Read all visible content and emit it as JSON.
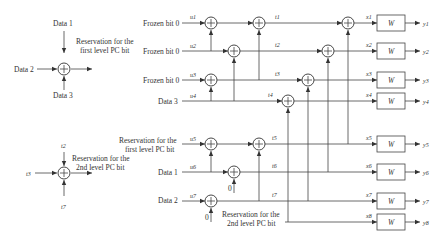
{
  "legend_top": {
    "inputs": {
      "top": "Data 1",
      "left": "Data 2",
      "bottom": "Data 3"
    },
    "output": [
      "Reservation for the",
      "first level PC bit"
    ]
  },
  "legend_bottom": {
    "inputs": {
      "top": "t2",
      "left": "t3",
      "bottom": "t7"
    },
    "output": [
      "Reservation for the",
      "2nd level PC bit"
    ]
  },
  "inputs": [
    {
      "label": "Frozen bit 0",
      "u": "u1"
    },
    {
      "label": "Frozen bit 0",
      "u": "u2"
    },
    {
      "label": "Frozen bit 0",
      "u": "u3"
    },
    {
      "label": "Data 3",
      "u": "u4"
    },
    {
      "label": [
        "Reservation for the",
        "first level PC bit"
      ],
      "u": "u5"
    },
    {
      "label": "Data 1",
      "u": "u6"
    },
    {
      "label": "Data 2",
      "u": "u7"
    },
    {
      "label": [
        "Reservation for the",
        "2nd level PC bit"
      ],
      "u": "u8"
    }
  ],
  "stage1_labels": [
    "t1",
    "t2",
    "t3",
    "t4",
    "t5",
    "t6",
    "t7"
  ],
  "zero_inputs": [
    "0",
    "0"
  ],
  "outputs": [
    {
      "x": "x1",
      "channel": "W",
      "y": "y1"
    },
    {
      "x": "x2",
      "channel": "W",
      "y": "y2"
    },
    {
      "x": "x3",
      "channel": "W",
      "y": "y3"
    },
    {
      "x": "x4",
      "channel": "W",
      "y": "y4"
    },
    {
      "x": "x5",
      "channel": "W",
      "y": "y5"
    },
    {
      "x": "x6",
      "channel": "W",
      "y": "y6"
    },
    {
      "x": "x7",
      "channel": "W",
      "y": "y7"
    },
    {
      "x": "x8",
      "channel": "W",
      "y": "y8"
    }
  ]
}
